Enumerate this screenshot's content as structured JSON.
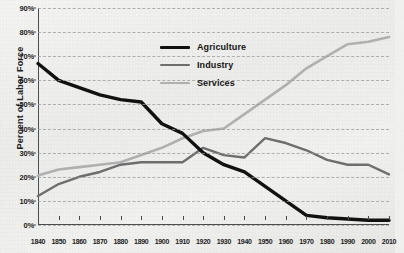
{
  "chart_data": {
    "type": "line",
    "title": "",
    "xlabel": "",
    "ylabel": "Percent of Labor Force",
    "xlim": [
      1840,
      2010
    ],
    "ylim": [
      0,
      90
    ],
    "ytick_labels": [
      "0%",
      "10%",
      "20%",
      "30%",
      "40%",
      "50%",
      "60%",
      "70%",
      "80%",
      "90%"
    ],
    "ytick_values": [
      0,
      10,
      20,
      30,
      40,
      50,
      60,
      70,
      80,
      90
    ],
    "grid": true,
    "legend_position": "inside-upper-center",
    "categories": [
      1840,
      1850,
      1860,
      1870,
      1880,
      1890,
      1900,
      1910,
      1920,
      1930,
      1940,
      1950,
      1960,
      1970,
      1980,
      1990,
      2000,
      2010
    ],
    "xtick_labels": [
      "1840",
      "1850",
      "1860",
      "1870",
      "1880",
      "1890",
      "1900",
      "1910",
      "1920",
      "1930",
      "1940",
      "1950",
      "1960",
      "1970",
      "1980",
      "1990",
      "2000",
      "2010"
    ],
    "series": [
      {
        "name": "Agriculture",
        "color": "#111111",
        "width": 3.4,
        "values": [
          67,
          60,
          57,
          54,
          52,
          51,
          42,
          38,
          30,
          25,
          22,
          16,
          10,
          4,
          3,
          2.5,
          2,
          2
        ]
      },
      {
        "name": "Industry",
        "color": "#6e6e6e",
        "width": 2.4,
        "values": [
          12,
          17,
          20,
          22,
          25,
          26,
          26,
          26,
          32,
          29,
          28,
          36,
          34,
          31,
          27,
          25,
          25,
          21
        ]
      },
      {
        "name": "Services",
        "color": "#b0b0b0",
        "width": 2.6,
        "values": [
          20.5,
          23,
          24,
          25,
          26,
          29,
          32,
          36,
          39,
          40,
          46,
          52,
          58,
          65,
          70,
          75,
          76,
          78
        ]
      }
    ]
  },
  "legend": {
    "items": [
      {
        "label": "Agriculture"
      },
      {
        "label": "Industry"
      },
      {
        "label": "Services"
      }
    ]
  }
}
